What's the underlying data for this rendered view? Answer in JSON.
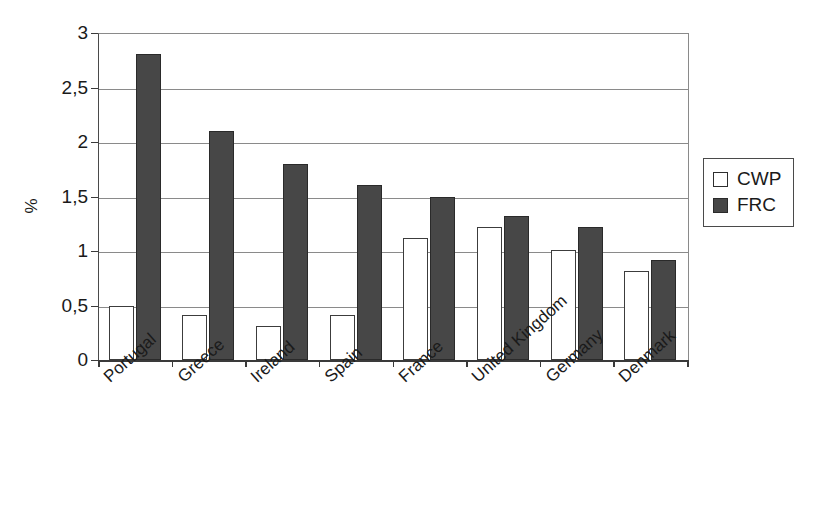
{
  "chart_data": {
    "type": "bar",
    "title": "",
    "xlabel": "",
    "ylabel": "%",
    "ylim": [
      0,
      3
    ],
    "ytick_labels": [
      "3",
      "2,5",
      "2",
      "1,5",
      "1",
      "0,5",
      "0"
    ],
    "ytick_values": [
      3,
      2.5,
      2,
      1.5,
      1,
      0.5,
      0
    ],
    "grid": "horizontal",
    "legend_position": "right",
    "decimal_separator": ",",
    "categories": [
      "Portugal",
      "Greece",
      "Ireland",
      "Spain",
      "France",
      "United Kingdom",
      "Germany",
      "Denmark"
    ],
    "series": [
      {
        "name": "CWP",
        "color": "#ffffff",
        "values": [
          0.5,
          0.41,
          0.31,
          0.41,
          1.12,
          1.22,
          1.01,
          0.82
        ]
      },
      {
        "name": "FRC",
        "color": "#474747",
        "values": [
          2.81,
          2.1,
          1.8,
          1.61,
          1.5,
          1.32,
          1.22,
          0.92
        ]
      }
    ]
  },
  "legend": {
    "items": [
      {
        "label": "CWP",
        "swatch": "hollow-square"
      },
      {
        "label": "FRC",
        "swatch": "filled-square"
      }
    ]
  },
  "axis": {
    "y_title": "%"
  }
}
